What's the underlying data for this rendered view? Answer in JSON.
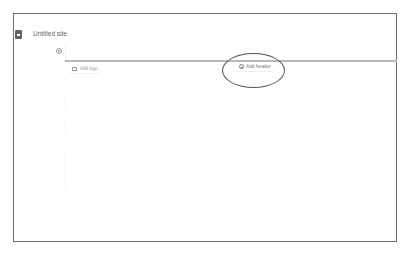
{
  "app": {
    "title": "Untitled site",
    "icon": "document-icon"
  },
  "header": {
    "settings_icon": "gear-icon",
    "add_logo": {
      "label": "Add logo",
      "icon": "image-icon"
    },
    "add_header": {
      "label": "Add header",
      "icon": "plus-circle-icon"
    }
  },
  "annotation": {
    "shape": "ellipse",
    "target": "add-header-button",
    "color": "#555555"
  },
  "colors": {
    "frame_border": "#6d6d6d",
    "text_primary": "#5f6368",
    "text_secondary": "#9e9e9e",
    "divider": "#b9b9b9"
  }
}
